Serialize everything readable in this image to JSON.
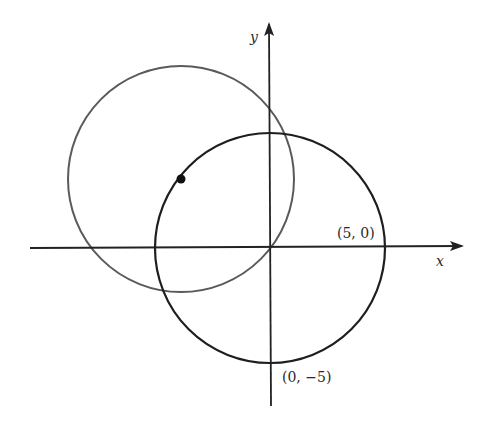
{
  "diagram": {
    "axes": {
      "x_label": "x",
      "y_label": "y",
      "color": "#222222"
    },
    "circles": [
      {
        "name": "circle-origin",
        "center": [
          0,
          0
        ],
        "radius": 5,
        "color": "#1e1e1e"
      },
      {
        "name": "circle-offset",
        "center": [
          -3.9,
          3
        ],
        "radius": 4.9,
        "color": "#555555"
      }
    ],
    "point": {
      "name": "center-point",
      "color": "#111111"
    },
    "labels": {
      "point_5_0": "(5, 0)",
      "point_0_m5": "(0, −5)"
    }
  }
}
